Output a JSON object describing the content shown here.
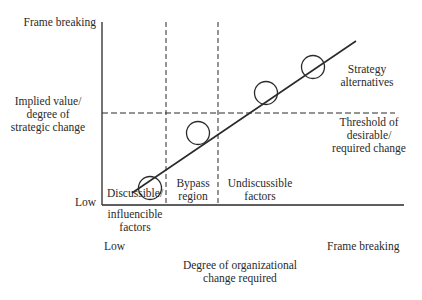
{
  "y_axis": {
    "top_label": "Frame breaking",
    "middle_label_lines": [
      "Implied value/",
      "degree of",
      "strategic change"
    ],
    "bottom_label": "Low"
  },
  "x_axis": {
    "left_label": "Low",
    "right_label": "Frame breaking",
    "title_lines": [
      "Degree of organizational",
      "change required"
    ]
  },
  "regions": [
    {
      "name": "discussible",
      "lines": [
        "Discussible/",
        "influencible",
        "factors"
      ]
    },
    {
      "name": "bypass",
      "lines": [
        "Bypass",
        "region"
      ]
    },
    {
      "name": "undiscussible",
      "lines": [
        "Undiscussible",
        "factors"
      ]
    }
  ],
  "threshold_label_lines": [
    "Threshold of",
    "desirable/",
    "required change"
  ],
  "strategy_label_lines": [
    "Strategy",
    "alternatives"
  ],
  "strategy_alternatives_count": 4,
  "colors": {
    "ink": "#2a2a2a",
    "background": "#ffffff"
  }
}
